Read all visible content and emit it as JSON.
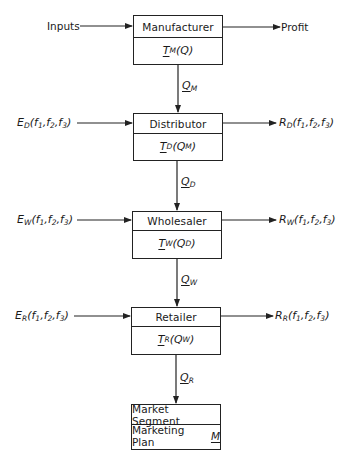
{
  "diagram": {
    "type": "supply-chain-flow",
    "nodes": [
      {
        "id": "manufacturer",
        "title": "Manufacturer",
        "func_symbol": "T",
        "func_sub": "M",
        "func_arg": "Q",
        "func_arg_sub": ""
      },
      {
        "id": "distributor",
        "title": "Distributor",
        "func_symbol": "T",
        "func_sub": "D",
        "func_arg": "Q",
        "func_arg_sub": "M"
      },
      {
        "id": "wholesaler",
        "title": "Wholesaler",
        "func_symbol": "T",
        "func_sub": "W",
        "func_arg": "Q",
        "func_arg_sub": "D"
      },
      {
        "id": "retailer",
        "title": "Retailer",
        "func_symbol": "T",
        "func_sub": "R",
        "func_arg": "Q",
        "func_arg_sub": "W"
      },
      {
        "id": "market",
        "title": "Market Segment",
        "bottom_text": "Marketing Plan",
        "bottom_symbol": "M"
      }
    ],
    "left_inputs": [
      {
        "text": "Inputs"
      },
      {
        "symbol": "E",
        "sub": "D",
        "args": "(f",
        "a1": "1",
        "a2": "2",
        "a3": "3"
      },
      {
        "symbol": "E",
        "sub": "W",
        "args": "(f",
        "a1": "1",
        "a2": "2",
        "a3": "3"
      },
      {
        "symbol": "E",
        "sub": "R",
        "args": "(f",
        "a1": "1",
        "a2": "2",
        "a3": "3"
      }
    ],
    "right_outputs": [
      {
        "text": "Profit"
      },
      {
        "symbol": "R",
        "sub": "D"
      },
      {
        "symbol": "R",
        "sub": "W"
      },
      {
        "symbol": "R",
        "sub": "R"
      }
    ],
    "flows": [
      {
        "symbol": "Q",
        "sub": "M"
      },
      {
        "symbol": "Q",
        "sub": "D"
      },
      {
        "symbol": "Q",
        "sub": "W"
      },
      {
        "symbol": "Q",
        "sub": "R"
      }
    ],
    "fargs": {
      "f": "f",
      "s1": "1",
      "s2": "2",
      "s3": "3",
      "open": "(",
      "close": ")",
      "comma": ","
    }
  }
}
